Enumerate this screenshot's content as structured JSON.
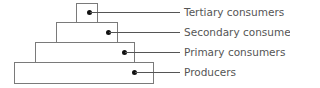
{
  "diagram": {
    "type": "ecological-pyramid",
    "levels": [
      {
        "label": "Tertiary consumers"
      },
      {
        "label": "Secondary consumers"
      },
      {
        "label": "Primary consumers"
      },
      {
        "label": "Producers"
      }
    ]
  }
}
